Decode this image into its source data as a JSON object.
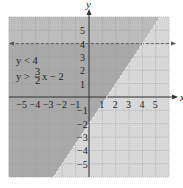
{
  "chart_data": {
    "type": "area",
    "title": "",
    "xlabel": "x",
    "ylabel": "y",
    "xlim": [
      -6,
      6
    ],
    "ylim": [
      -6,
      6
    ],
    "grid": true,
    "x_ticks": [
      "-5",
      "-4",
      "-3",
      "-2",
      "-1",
      "1",
      "2",
      "3",
      "4",
      "5"
    ],
    "y_ticks": [
      "5",
      "4",
      "3",
      "2",
      "1",
      "-1",
      "-2",
      "-3",
      "-4",
      "-5"
    ],
    "x_tick_values": [
      -5,
      -4,
      -3,
      -2,
      -1,
      1,
      2,
      3,
      4,
      5
    ],
    "y_tick_values": [
      5,
      4,
      3,
      2,
      1,
      -1,
      -2,
      -3,
      -4,
      -5
    ],
    "series": [
      {
        "name": "y < 4",
        "boundary": "y = 4",
        "style": "dashed",
        "shading": "below"
      },
      {
        "name": "y > (3/2)x - 2",
        "boundary": "y = 1.5x - 2",
        "style": "dashed",
        "shading": "above"
      }
    ],
    "annotations": [
      {
        "text_lines": [
          "y < 4",
          "y > 3/2 x − 2"
        ],
        "position": [
          -5.5,
          2.5
        ]
      }
    ],
    "legend_position": "none"
  },
  "labels": {
    "x_axis": "x",
    "y_axis": "y",
    "ineq1": "y < 4",
    "ineq2_prefix": "y >",
    "ineq2_num": "3",
    "ineq2_den": "2",
    "ineq2_suffix": "x − 2"
  },
  "colors": {
    "background": "#d8d8d8",
    "solution_half": "#bcbcbc",
    "solution_both": "#a9a9a9",
    "grid": "#9a9a9a",
    "axis": "#333333"
  }
}
